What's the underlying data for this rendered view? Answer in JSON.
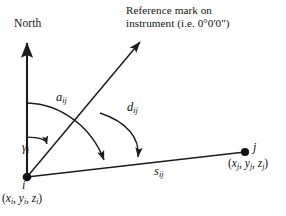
{
  "figure": {
    "kind": "survey-angle-diagram",
    "background_color": "#ffffff",
    "stroke_color": "#1c1c1c",
    "labels": {
      "north": "North",
      "reference_mark_line1": "Reference mark on",
      "reference_mark_line2": "instrument (i.e. 0°0'0\")",
      "azimuth_symbol": "a",
      "azimuth_subscript": "ij",
      "direction_symbol": "d",
      "direction_subscript": "ij",
      "gamma_symbol": "γ",
      "gamma_subscript": "i",
      "distance_symbol": "s",
      "distance_subscript": "ij",
      "station_i": "i",
      "station_i_coords": "(xᵢ, yᵢ, zᵢ)",
      "station_i_coords_parts": {
        "open": "(",
        "x": "x",
        "x_sub": "i",
        "sep1": ", ",
        "y": "y",
        "y_sub": "i",
        "sep2": ", ",
        "z": "z",
        "z_sub": "i",
        "close": ")"
      },
      "station_j": "j",
      "station_j_coords_parts": {
        "open": "(",
        "x": "x",
        "x_sub": "j",
        "sep1": ", ",
        "y": "y",
        "y_sub": "j",
        "sep2": ", ",
        "z": "z",
        "z_sub": "j",
        "close": ")"
      }
    },
    "geometry": {
      "origin": {
        "x": 27,
        "y": 177
      },
      "north_axis_tip": {
        "x": 27,
        "y": 37
      },
      "reference_ray_tip": {
        "x": 144,
        "y": 38
      },
      "station_j_point": {
        "x": 245,
        "y": 152
      },
      "azimuth_arc_start_on_axis": {
        "x": 27,
        "y": 103
      },
      "azimuth_arc_arrow_on_baseline": {
        "x": 105,
        "y": 168
      },
      "direction_arc_arrow_on_baseline": {
        "x": 138,
        "y": 165
      },
      "gamma_arc_start_on_axis": {
        "x": 27,
        "y": 137
      },
      "gamma_arc_arrow_on_ray": {
        "x": 47,
        "y": 149
      }
    },
    "icon_names": {
      "north_arrow": "north-arrow-icon",
      "reference_ray_arrow": "reference-ray-arrow-icon",
      "azimuth_arc_arrow": "azimuth-arc-arrow-icon",
      "direction_arc_arrow": "direction-arc-arrow-icon",
      "gamma_arc_arrow": "gamma-arc-arrow-icon",
      "station_i_dot": "station-i-dot-icon",
      "station_j_dot": "station-j-dot-icon"
    }
  }
}
